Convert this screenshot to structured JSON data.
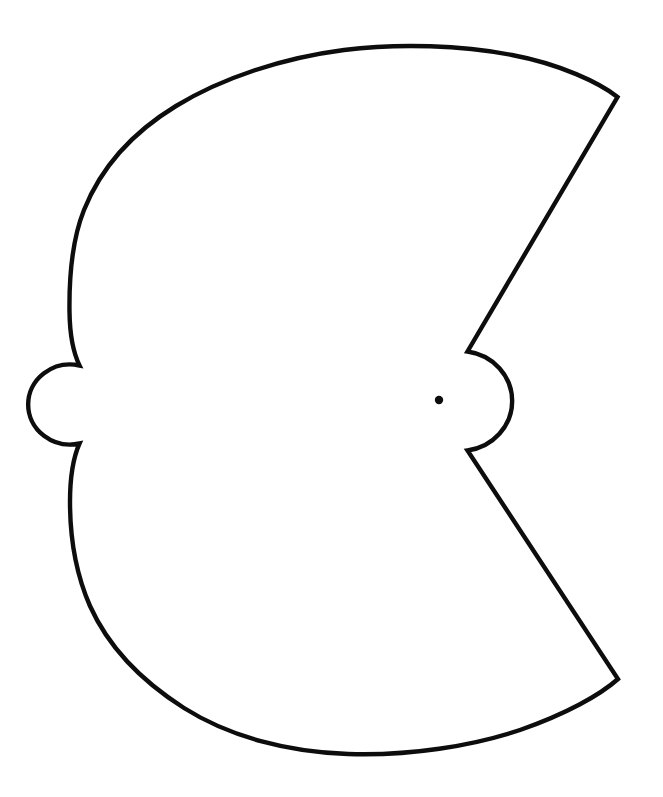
{
  "document": {
    "title": "Fan Sector Template Outline",
    "background_color": "#ffffff",
    "width": 663,
    "height": 797
  },
  "drawing": {
    "name": "fan-sector-outline",
    "description": "Technical line drawing of a circular sector (fan shape) with a semicircular tab on the left edge, a semicircular cutout around the pivot, and a wedge notch opening to the right",
    "stroke_color": "#0d0d0d",
    "stroke_width": 4.4,
    "fill": "none",
    "pivot": {
      "label": "pivot-point",
      "cx": 439,
      "cy": 400,
      "r": 4.2,
      "color": "#0d0d0d"
    },
    "geometry": {
      "main_arc_center_x": 439,
      "main_arc_center_y": 400,
      "main_arc_radius_x": 370,
      "main_arc_radius_y": 352,
      "top_vertex_x": 617,
      "top_vertex_y": 97,
      "bottom_vertex_x": 618,
      "bottom_vertex_y": 700,
      "notch_upper_vertex_x": 467,
      "notch_upper_vertex_y": 352,
      "notch_lower_vertex_x": 467,
      "notch_lower_vertex_y": 450,
      "hub_arc_radius": 50,
      "hub_arc_right_x": 504,
      "left_tab_top_x": 80,
      "left_tab_top_y": 365,
      "left_tab_bottom_x": 80,
      "left_tab_bottom_y": 444,
      "left_tab_extent_x": 34,
      "leftmost_arc_x": 69,
      "topmost_arc_y": 46,
      "bottommost_arc_y": 751
    },
    "path_d": "M 617.5 97 C 600 83 560 64 512 55 C 462 45.5 400 43 344 50 C 282 58 222 78 176 106 C 130 134 100 170 84 210 C 72 240 69 275 69.5 312 C 69.8 334 73 352 79.5 365.5 L 79.5 365.5 A 42 40 0 1 0 79.5 443.5 L 79.5 443.5 C 73 458 70 478 70 502 C 70 540 76 574 90 606 C 108 646 140 680 184 708 C 230 737 288 752 348 754 C 410 756 472 746 520 730 C 566 714 600 695 618 679 L 467.5 450.5 L 467.5 450.5 A 52 50 0 0 0 467.5 351.5 L 467.5 351.5 Z",
    "segments": [
      {
        "name": "upper-outer-arc",
        "type": "arc",
        "from": "top-vertex",
        "to": "left-tab-top"
      },
      {
        "name": "left-tab-semicircle",
        "type": "arc",
        "from": "left-tab-top",
        "to": "left-tab-bottom"
      },
      {
        "name": "lower-outer-arc",
        "type": "arc",
        "from": "left-tab-bottom",
        "to": "bottom-vertex"
      },
      {
        "name": "lower-radial-line",
        "type": "line",
        "from": "bottom-vertex",
        "to": "notch-lower-vertex"
      },
      {
        "name": "hub-semicircle",
        "type": "arc",
        "from": "notch-lower-vertex",
        "to": "notch-upper-vertex"
      },
      {
        "name": "upper-radial-line",
        "type": "line",
        "from": "notch-upper-vertex",
        "to": "top-vertex"
      }
    ]
  }
}
